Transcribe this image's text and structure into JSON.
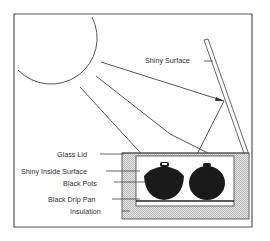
{
  "diagram": {
    "type": "solar-box-cooker",
    "labels": {
      "shiny_surface": "Shiny Surface",
      "glass_lid": "Glass Lid",
      "shiny_inside_surface": "Shiny Inside Surface",
      "black_pots": "Black Pots",
      "black_drip_pan": "Black Drip Pan",
      "insulation": "Insulation"
    },
    "colors": {
      "line": "#444444",
      "pot": "#1a1a1a",
      "insulation": "#cfcfcf",
      "background": "#ffffff"
    },
    "elements": [
      "sun",
      "sun-rays",
      "reflector",
      "box",
      "glass-lid",
      "pots",
      "drip-pan",
      "insulation"
    ]
  }
}
